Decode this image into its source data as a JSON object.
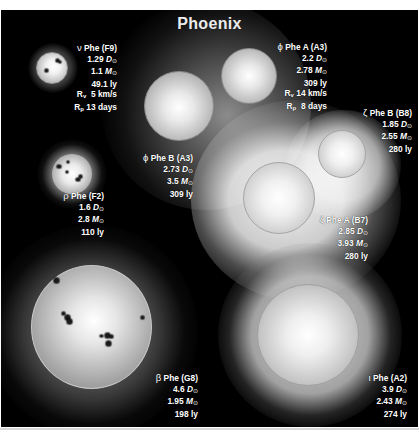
{
  "title": "Phoenix",
  "colors": {
    "background": "#000000",
    "text": "#ffffff",
    "frame": "#ffffff"
  },
  "stars": [
    {
      "id": "nu-phe",
      "name": "ν Phe (F9)",
      "symbol": "ν",
      "designation": "Phe (F9)",
      "diameter": "1.29",
      "mass": "1.1",
      "distance": "49.1 ly",
      "rv_label": "R",
      "rv_sub": "v",
      "rv_value": "5 km/s",
      "rp_label": "R",
      "rp_sub": "p",
      "rp_value": "13 days",
      "has_spots": true
    },
    {
      "id": "phi-phe-a",
      "name": "ϕ Phe A (A3)",
      "symbol": "ϕ",
      "designation": "Phe A (A3)",
      "diameter": "2.2",
      "mass": "2.78",
      "distance": "309 ly",
      "rv_label": "R",
      "rv_sub": "v",
      "rv_value": "14 km/s",
      "rp_label": "R",
      "rp_sub": "p",
      "rp_value": "8 days"
    },
    {
      "id": "phi-phe-b",
      "name": "ϕ Phe B (A3)",
      "symbol": "ϕ",
      "designation": "Phe B (A3)",
      "diameter": "2.73",
      "mass": "3.5",
      "distance": "309 ly"
    },
    {
      "id": "zeta-phe-b",
      "name": "ζ Phe B (B8)",
      "symbol": "ζ",
      "designation": "Phe B (B8)",
      "diameter": "1.85",
      "mass": "2.55",
      "distance": "280 ly"
    },
    {
      "id": "rho-phe",
      "name": "ρ Phe (F2)",
      "symbol": "ρ",
      "designation": "Phe (F2)",
      "diameter": "1.6",
      "mass": "2.8",
      "distance": "110 ly",
      "has_spots": true
    },
    {
      "id": "zeta-phe-a",
      "name": "ζ Phe A (B7)",
      "symbol": "ζ",
      "designation": "Phe A (B7)",
      "diameter": "2.85",
      "mass": "3.93",
      "distance": "280 ly"
    },
    {
      "id": "beta-phe",
      "name": "β Phe (G8)",
      "symbol": "β",
      "designation": "Phe (G8)",
      "diameter": "4.6",
      "mass": "1.95",
      "distance": "198 ly",
      "has_spots": true
    },
    {
      "id": "iota-phe",
      "name": "ι Phe (A2)",
      "symbol": "ι",
      "designation": "Phe (A2)",
      "diameter": "3.9",
      "mass": "2.43",
      "distance": "274 ly"
    }
  ],
  "units": {
    "diameter": "D",
    "mass": "M",
    "sun_symbol": "⊙"
  }
}
